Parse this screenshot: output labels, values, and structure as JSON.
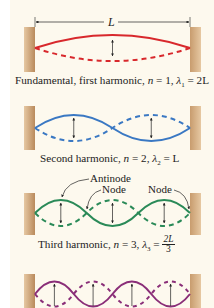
{
  "figure": {
    "length_label": "L",
    "colors": {
      "harmonic1": "#d8282c",
      "harmonic2": "#3a78c3",
      "harmonic3": "#2a8a58",
      "harmonic4": "#8a2e78",
      "wall_light": "#e3c49e",
      "wall_dark": "#b88a5c",
      "background": "#fdf9ee"
    },
    "harmonics": [
      {
        "n": 1,
        "caption_prefix": "Fundamental, first harmonic, ",
        "n_var": "n",
        "n_eq": " = 1,  ",
        "lambda_sym": "λ",
        "lambda_sub": "1",
        "lambda_eq": " = 2L"
      },
      {
        "n": 2,
        "caption_prefix": "Second harmonic, ",
        "n_var": "n",
        "n_eq": " = 2,  ",
        "lambda_sym": "λ",
        "lambda_sub": "2",
        "lambda_eq": " = L"
      },
      {
        "n": 3,
        "caption_prefix": "Third harmonic, ",
        "n_var": "n",
        "n_eq": " = 3,  ",
        "lambda_sym": "λ",
        "lambda_sub": "3",
        "lambda_eq": " = ",
        "frac_num": "2L",
        "frac_den": "3"
      },
      {
        "n": 4
      }
    ],
    "annotations": {
      "antinode": "Antinode",
      "node_left": "Node",
      "node_right": "Node"
    }
  }
}
